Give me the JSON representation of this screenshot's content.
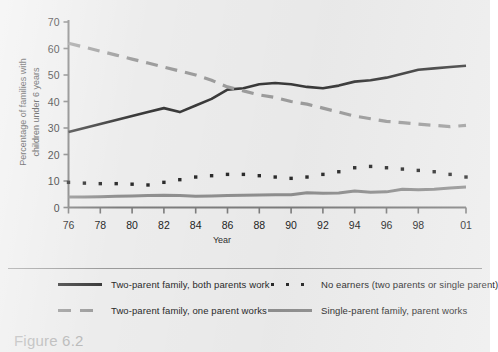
{
  "figure": {
    "caption": "Figure 6.2"
  },
  "chart_data": {
    "type": "line",
    "title": "",
    "xlabel": "Year",
    "ylabel": "Percentage of families with children under 6 years",
    "ylim": [
      0,
      70
    ],
    "ytick_labels": [
      "0",
      "10",
      "20",
      "30",
      "40",
      "50",
      "60",
      "70"
    ],
    "ytick_values": [
      0,
      10,
      20,
      30,
      40,
      50,
      60,
      70
    ],
    "xlim": [
      1976,
      2001
    ],
    "xtick_labels": [
      "76",
      "78",
      "80",
      "82",
      "84",
      "86",
      "88",
      "90",
      "92",
      "94",
      "96",
      "98",
      "01"
    ],
    "xtick_values": [
      1976,
      1978,
      1980,
      1982,
      1984,
      1986,
      1988,
      1990,
      1992,
      1994,
      1996,
      1998,
      2001
    ],
    "grid": false,
    "legend_position": "below",
    "x": [
      1976,
      1977,
      1978,
      1979,
      1980,
      1981,
      1982,
      1983,
      1984,
      1985,
      1986,
      1987,
      1988,
      1989,
      1990,
      1991,
      1992,
      1993,
      1994,
      1995,
      1996,
      1997,
      1998,
      1999,
      2000,
      2001
    ],
    "series": [
      {
        "name": "Two-parent family, both parents work",
        "style": "solid",
        "color": "#3a3a3a",
        "values": [
          28.5,
          30.0,
          31.5,
          33.0,
          34.5,
          36.0,
          37.5,
          36.0,
          38.5,
          41.0,
          44.5,
          45.0,
          46.5,
          47.0,
          46.5,
          45.5,
          45.0,
          46.0,
          47.5,
          48.0,
          49.0,
          50.5,
          52.0,
          52.5,
          53.0,
          53.5
        ]
      },
      {
        "name": "Two-parent family, one parent works",
        "style": "dashed",
        "color": "#9d9d9d",
        "values": [
          62.0,
          60.5,
          59.0,
          57.5,
          56.0,
          54.5,
          53.0,
          51.5,
          50.0,
          48.0,
          45.5,
          44.0,
          42.5,
          41.5,
          40.0,
          39.0,
          37.5,
          36.0,
          34.5,
          33.5,
          32.5,
          32.0,
          31.5,
          31.0,
          30.5,
          31.0
        ]
      },
      {
        "name": "No earners (two parents or single parent)",
        "style": "dotted",
        "color": "#2b2b2b",
        "values": [
          9.5,
          9.2,
          9.0,
          9.0,
          8.8,
          8.5,
          9.5,
          10.5,
          11.5,
          12.0,
          12.5,
          12.5,
          12.0,
          11.5,
          11.0,
          11.5,
          12.5,
          13.5,
          15.0,
          15.5,
          15.0,
          14.5,
          14.0,
          13.5,
          12.5,
          11.5
        ]
      },
      {
        "name": "Single-parent family, parent works",
        "style": "solid",
        "color": "#8f8f8f",
        "values": [
          4.0,
          4.0,
          4.1,
          4.2,
          4.3,
          4.5,
          4.6,
          4.5,
          4.2,
          4.3,
          4.5,
          4.6,
          4.7,
          4.8,
          4.8,
          5.6,
          5.4,
          5.5,
          6.2,
          5.8,
          5.9,
          6.9,
          6.7,
          6.9,
          7.4,
          7.7
        ]
      }
    ]
  },
  "legend": {
    "items": [
      {
        "label": "Two-parent family, both parents work"
      },
      {
        "label": "No earners (two parents or single parent)"
      },
      {
        "label": "Two-parent family, one parent works"
      },
      {
        "label": "Single-parent family, parent works"
      }
    ]
  }
}
